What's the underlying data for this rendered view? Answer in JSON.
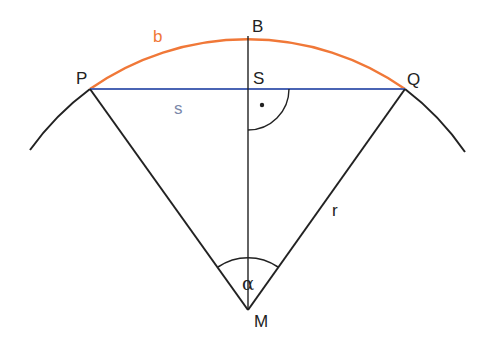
{
  "diagram": {
    "colors": {
      "arc_b": "#f07838",
      "chord_s": "#4a64b4",
      "label_s": "#7a88aa",
      "lines": "#222222",
      "background": "#ffffff"
    },
    "points": {
      "P": {
        "label": "P",
        "x": 90,
        "y": 89
      },
      "Q": {
        "label": "Q",
        "x": 405,
        "y": 89
      },
      "B": {
        "label": "B",
        "x": 248,
        "y": 36
      },
      "S": {
        "label": "S",
        "x": 248,
        "y": 89
      },
      "M": {
        "label": "M",
        "x": 248,
        "y": 310
      }
    },
    "labels": {
      "arc": "b",
      "chord": "s",
      "radius": "r",
      "angle": "α",
      "right_angle_marker": "•"
    },
    "circle": {
      "center": "M",
      "radius_px": 274
    }
  }
}
